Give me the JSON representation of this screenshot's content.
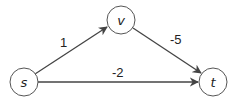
{
  "graph": {
    "nodes": [
      {
        "id": "s",
        "label": "s",
        "cx": 24,
        "cy": 82
      },
      {
        "id": "v",
        "label": "v",
        "cx": 121,
        "cy": 20
      },
      {
        "id": "t",
        "label": "t",
        "cx": 213,
        "cy": 82
      }
    ],
    "edges": [
      {
        "from": "s",
        "to": "v",
        "weight": "1"
      },
      {
        "from": "v",
        "to": "t",
        "weight": "-5"
      },
      {
        "from": "s",
        "to": "t",
        "weight": "-2"
      }
    ]
  },
  "colors": {
    "stroke": "#444444",
    "fill": "#ffffff",
    "text": "#222222"
  }
}
